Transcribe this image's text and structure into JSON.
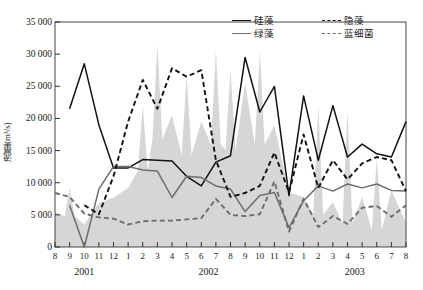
{
  "chart_data": {
    "type": "line",
    "title": "",
    "xlabel": "",
    "ylabel": "流量(m³/s)",
    "ylim": [
      0,
      35000
    ],
    "ytick_values": [
      0,
      5000,
      10000,
      15000,
      20000,
      25000,
      30000,
      35000
    ],
    "ytick_labels": [
      "0",
      "5 000",
      "10 000",
      "15 000",
      "20 000",
      "25 000",
      "30 000",
      "35 000"
    ],
    "grid": false,
    "legend_position": "top-center",
    "categories": [
      "8",
      "9",
      "10",
      "11",
      "12",
      "1",
      "2",
      "3",
      "4",
      "5",
      "6",
      "7",
      "8",
      "9",
      "10",
      "11",
      "12",
      "1",
      "2",
      "3",
      "4",
      "5",
      "6",
      "7",
      "8"
    ],
    "year_groups": [
      {
        "label": "2001",
        "start_index": 0,
        "end_index": 4
      },
      {
        "label": "2002",
        "start_index": 5,
        "end_index": 16
      },
      {
        "label": "2003",
        "start_index": 17,
        "end_index": 24
      }
    ],
    "series": [
      {
        "name": "硅藻",
        "style": "solid",
        "color": "#111111",
        "values": [
          null,
          21500,
          28500,
          19000,
          12300,
          12300,
          13600,
          13500,
          13400,
          11000,
          9500,
          13200,
          14200,
          29500,
          21000,
          25000,
          8000,
          23500,
          13500,
          22000,
          14000,
          16000,
          14500,
          14000,
          19500
        ]
      },
      {
        "name": "绿藻",
        "style": "solid",
        "color": "#6d6d6d",
        "values": [
          null,
          6500,
          0,
          9000,
          12500,
          12500,
          12000,
          11800,
          7700,
          11000,
          10800,
          9500,
          9000,
          5500,
          8000,
          8500,
          3000,
          7200,
          9500,
          8700,
          9800,
          9200,
          9800,
          8800,
          8700
        ]
      },
      {
        "name": "隐藻",
        "style": "dashed",
        "color": "#111111",
        "values": [
          null,
          null,
          6500,
          5100,
          11000,
          19500,
          26000,
          21500,
          27800,
          26500,
          27500,
          13500,
          7800,
          8400,
          9500,
          14700,
          8500,
          17500,
          9200,
          13500,
          10500,
          13000,
          14000,
          13500,
          8700
        ]
      },
      {
        "name": "蓝细菌",
        "style": "dashed",
        "color": "#6d6d6d",
        "values": [
          8400,
          7800,
          5200,
          4600,
          4400,
          3500,
          4000,
          4100,
          4100,
          4300,
          4500,
          7500,
          5000,
          4800,
          5100,
          10200,
          2400,
          7500,
          3100,
          4800,
          3600,
          6100,
          6400,
          4700,
          6500
        ]
      }
    ],
    "background_area": {
      "name": "流量",
      "color": "#d6d6d6",
      "values": [
        5500,
        8700,
        3500,
        6800,
        7700,
        9200,
        21500,
        30500,
        20500,
        26000,
        19500,
        29000,
        27500,
        25500,
        29000,
        19000,
        8500,
        7800,
        9200,
        7000,
        6700,
        7800,
        4800,
        8800,
        3800
      ],
      "peaks": [
        {
          "index": 1,
          "value": 9200
        },
        {
          "index": 6,
          "value": 22000
        },
        {
          "index": 7,
          "value": 31500
        },
        {
          "index": 9,
          "value": 26800
        },
        {
          "index": 11,
          "value": 30500
        },
        {
          "index": 12,
          "value": 27500
        },
        {
          "index": 14,
          "value": 30500
        },
        {
          "index": 18,
          "value": 22000
        },
        {
          "index": 20,
          "value": 21000
        },
        {
          "index": 22,
          "value": 13800
        }
      ]
    }
  },
  "legend": {
    "items": [
      {
        "label": "硅藻",
        "style": "solid",
        "color": "#111111"
      },
      {
        "label": "绿藻",
        "style": "solid",
        "color": "#6d6d6d"
      },
      {
        "label": "隐藻",
        "style": "dashed",
        "color": "#111111"
      },
      {
        "label": "蓝细菌",
        "style": "dashed",
        "color": "#6d6d6d"
      }
    ]
  },
  "axes": {
    "y_title": "流量(m³/s)"
  }
}
